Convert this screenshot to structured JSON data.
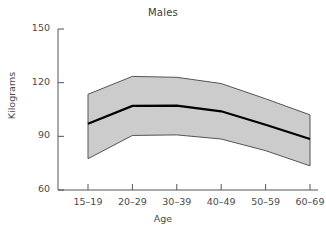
{
  "chart_data": {
    "type": "area",
    "title": "Males",
    "xlabel": "Age",
    "ylabel": "Kilograms",
    "categories": [
      "15–19",
      "20–29",
      "30–39",
      "40–49",
      "50–59",
      "60–69"
    ],
    "ytick_labels": [
      "150",
      "120",
      "90",
      "60"
    ],
    "yticks": [
      150,
      120,
      90,
      60
    ],
    "ylim": [
      60,
      150
    ],
    "grid": false,
    "legend": false,
    "series": [
      {
        "name": "Mean",
        "values": [
          97.0,
          107.0,
          107.2,
          104.0,
          96.5,
          88.5
        ]
      },
      {
        "name": "Upper bound",
        "values": [
          113.5,
          123.5,
          123.0,
          119.5,
          111.0,
          102.0
        ]
      },
      {
        "name": "Lower bound",
        "values": [
          77.5,
          90.5,
          90.8,
          88.5,
          82.0,
          73.5
        ]
      }
    ],
    "band_color": "#cccccc",
    "band_edge_color": "#555555",
    "line_color": "#000000",
    "axis_color": "#555555",
    "background_color": "#ffffff"
  },
  "labels": {
    "title": "Males",
    "x_axis_title": "Age",
    "y_axis_title": "Kilograms"
  }
}
